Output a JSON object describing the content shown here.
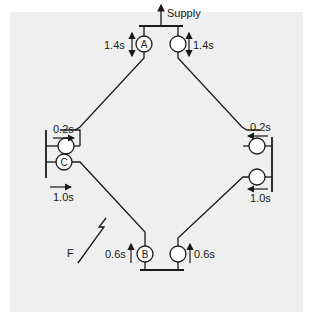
{
  "diagram": {
    "type": "ring-main protection coordination",
    "supply_label": "Supply",
    "fault_label": "F",
    "relays": [
      {
        "id": "A",
        "label": "A",
        "position": "top-left",
        "time": "1.4s",
        "direction": "bidirectional-vertical"
      },
      {
        "id": "top-right",
        "label": "",
        "position": "top-right",
        "time": "1.4s",
        "direction": "bidirectional-vertical"
      },
      {
        "id": "left-upper",
        "label": "",
        "position": "left-upper",
        "time": "0.2s",
        "direction": "right"
      },
      {
        "id": "C",
        "label": "C",
        "position": "left-lower",
        "time": "1.0s",
        "direction": "right"
      },
      {
        "id": "right-upper",
        "label": "",
        "position": "right-upper",
        "time": "0.2s",
        "direction": "left"
      },
      {
        "id": "right-lower",
        "label": "",
        "position": "right-lower",
        "time": "1.0s",
        "direction": "left"
      },
      {
        "id": "B",
        "label": "B",
        "position": "bottom-left",
        "time": "0.6s",
        "direction": "up"
      },
      {
        "id": "bottom-right",
        "label": "",
        "position": "bottom-right",
        "time": "0.6s",
        "direction": "up"
      }
    ]
  },
  "colors": {
    "background": "#efefef",
    "line": "#1a1a1a",
    "relay_fill": "#ffffff"
  }
}
